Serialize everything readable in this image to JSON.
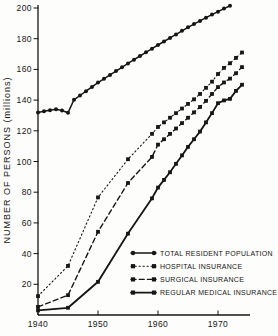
{
  "page": {
    "background": "#fdfdfb",
    "ink_color": "#161616"
  },
  "chart_data": {
    "type": "line",
    "title": "",
    "xlabel": "",
    "ylabel": "NUMBER OF PERSONS (millions)",
    "xlim": [
      1940,
      1975
    ],
    "ylim": [
      0,
      200
    ],
    "grid": false,
    "legend_position": "lower-right",
    "x_ticks": [
      "1940",
      "1950",
      "1960",
      "1970"
    ],
    "x_tick_years": [
      1940,
      1950,
      1960,
      1970
    ],
    "y_ticks": [
      20,
      40,
      60,
      80,
      100,
      120,
      140,
      160,
      180,
      200
    ],
    "series": [
      {
        "name": "TOTAL RESIDENT POPULATION",
        "marker": "circle",
        "line_style": "solid",
        "stroke_width": 1.5,
        "x": [
          1940,
          1941,
          1942,
          1943,
          1944,
          1945,
          1946,
          1947,
          1948,
          1949,
          1950,
          1951,
          1952,
          1953,
          1954,
          1955,
          1956,
          1957,
          1958,
          1959,
          1960,
          1961,
          1962,
          1963,
          1964,
          1965,
          1966,
          1967,
          1968,
          1969,
          1970,
          1971,
          1972
        ],
        "values": [
          132.0,
          132.8,
          133.4,
          134.0,
          133.2,
          131.8,
          140.2,
          143.0,
          145.8,
          148.6,
          151.4,
          153.9,
          156.4,
          158.9,
          161.4,
          163.9,
          166.3,
          168.7,
          171.1,
          173.5,
          175.9,
          178.2,
          180.5,
          182.8,
          185.1,
          187.4,
          189.5,
          191.6,
          193.7,
          195.7,
          197.6,
          199.6,
          201.5
        ]
      },
      {
        "name": "HOSPITAL INSURANCE",
        "marker": "square",
        "line_style": "dotted",
        "stroke_width": 1.1,
        "x": [
          1940,
          1945,
          1950,
          1955,
          1959,
          1960,
          1961,
          1962,
          1963,
          1964,
          1965,
          1966,
          1967,
          1968,
          1969,
          1970,
          1971,
          1972,
          1973,
          1974
        ],
        "values": [
          12.3,
          32.0,
          76.6,
          101.5,
          118.0,
          122.5,
          125.5,
          128.5,
          131.5,
          134.5,
          137.5,
          140.5,
          144.0,
          148.0,
          152.0,
          157.0,
          161.0,
          164.0,
          167.5,
          171.0
        ]
      },
      {
        "name": "SURGICAL INSURANCE",
        "marker": "square",
        "line_style": "dashed",
        "stroke_width": 1.4,
        "x": [
          1940,
          1945,
          1950,
          1955,
          1959,
          1960,
          1961,
          1962,
          1963,
          1964,
          1965,
          1966,
          1967,
          1968,
          1969,
          1970,
          1971,
          1972,
          1973,
          1974
        ],
        "values": [
          5.3,
          12.9,
          54.2,
          86.0,
          103.0,
          111.0,
          114.5,
          118.0,
          121.5,
          125.0,
          128.5,
          132.0,
          135.5,
          139.5,
          144.0,
          148.5,
          151.5,
          154.0,
          157.5,
          161.5
        ]
      },
      {
        "name": "REGULAR MEDICAL INSURANCE",
        "marker": "square",
        "line_style": "solid",
        "stroke_width": 1.8,
        "x": [
          1940,
          1945,
          1950,
          1955,
          1959,
          1960,
          1961,
          1962,
          1963,
          1964,
          1965,
          1966,
          1967,
          1968,
          1969,
          1970,
          1971,
          1972,
          1973,
          1974
        ],
        "values": [
          3.0,
          4.7,
          21.6,
          53.0,
          76.0,
          83.0,
          88.0,
          93.0,
          98.5,
          104.0,
          109.5,
          114.5,
          119.5,
          125.5,
          131.5,
          138.0,
          139.8,
          140.8,
          146.0,
          150.0
        ]
      }
    ]
  }
}
